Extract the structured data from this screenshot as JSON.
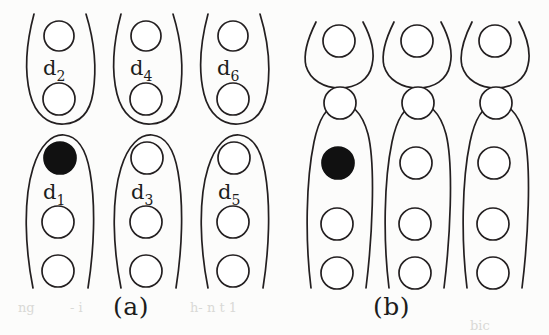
{
  "figure": {
    "type": "line-diagram",
    "background_color": "#fcfcfb",
    "stroke_color": "#231f20",
    "fill_marked_color": "#111111",
    "fill_unmarked_color": "#ffffff",
    "panels": [
      {
        "id": "a",
        "caption": "(a)",
        "description": "Six elongated cells arranged in two rows of three; each cell labelled d with a subscript. Top row labelled d2, d4, d6 (short closed cells with two circles). Bottom row labelled d1, d3, d5 (long cells cut off at the bottom edge, with three visible circles). The topmost circle of cell d1 is filled solid black.",
        "cells": [
          {
            "name": "d2",
            "label": "d",
            "subscript": "2",
            "row": "top",
            "column": 1,
            "circle_count": 2,
            "filled_circle_indices": []
          },
          {
            "name": "d4",
            "label": "d",
            "subscript": "4",
            "row": "top",
            "column": 2,
            "circle_count": 2,
            "filled_circle_indices": []
          },
          {
            "name": "d6",
            "label": "d",
            "subscript": "6",
            "row": "top",
            "column": 3,
            "circle_count": 2,
            "filled_circle_indices": []
          },
          {
            "name": "d1",
            "label": "d",
            "subscript": "1",
            "row": "bottom",
            "column": 1,
            "circle_count": 3,
            "filled_circle_indices": [
              0
            ]
          },
          {
            "name": "d3",
            "label": "d",
            "subscript": "3",
            "row": "bottom",
            "column": 2,
            "circle_count": 3,
            "filled_circle_indices": []
          },
          {
            "name": "d5",
            "label": "d",
            "subscript": "5",
            "row": "bottom",
            "column": 3,
            "circle_count": 3,
            "filled_circle_indices": []
          }
        ]
      },
      {
        "id": "b",
        "caption": "(b)",
        "description": "Three columns. Each column has a small bowl-shaped open cell at top holding one circle, and a long unlabelled cell below holding four circles and running off the bottom edge. The second circle of the leftmost long cell is filled solid black.",
        "cells": [
          {
            "name": "b-top-1",
            "label": "",
            "subscript": "",
            "row": "top",
            "column": 1,
            "circle_count": 1,
            "filled_circle_indices": []
          },
          {
            "name": "b-top-2",
            "label": "",
            "subscript": "",
            "row": "top",
            "column": 2,
            "circle_count": 1,
            "filled_circle_indices": []
          },
          {
            "name": "b-top-3",
            "label": "",
            "subscript": "",
            "row": "top",
            "column": 3,
            "circle_count": 1,
            "filled_circle_indices": []
          },
          {
            "name": "b-bottom-1",
            "label": "",
            "subscript": "",
            "row": "bottom",
            "column": 1,
            "circle_count": 4,
            "filled_circle_indices": [
              1
            ]
          },
          {
            "name": "b-bottom-2",
            "label": "",
            "subscript": "",
            "row": "bottom",
            "column": 2,
            "circle_count": 4,
            "filled_circle_indices": []
          },
          {
            "name": "b-bottom-3",
            "label": "",
            "subscript": "",
            "row": "bottom",
            "column": 3,
            "circle_count": 4,
            "filled_circle_indices": []
          }
        ]
      }
    ]
  },
  "captions": {
    "a": "(a)",
    "b": "(b)"
  },
  "labels": {
    "d1": {
      "base": "d",
      "sub": "1"
    },
    "d2": {
      "base": "d",
      "sub": "2"
    },
    "d3": {
      "base": "d",
      "sub": "3"
    },
    "d4": {
      "base": "d",
      "sub": "4"
    },
    "d5": {
      "base": "d",
      "sub": "5"
    },
    "d6": {
      "base": "d",
      "sub": "6"
    }
  },
  "ghost_text": {
    "line1_left": "ng",
    "line1_mid": "- i",
    "line1_right": "h- n  t 1",
    "line2_right": "bic"
  }
}
